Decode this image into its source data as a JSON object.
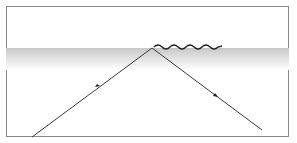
{
  "diagram": {
    "title": "",
    "colors": {
      "ray": "#3a3a3a",
      "frame": "#8a8a8a",
      "interface_shade": "#c8c8c8"
    },
    "incident_ray": {
      "from": [
        32,
        137
      ],
      "to": [
        152,
        48
      ]
    },
    "reflected_ray": {
      "from": [
        152,
        48
      ],
      "to": [
        262,
        130
      ]
    },
    "evanescent_wave": {
      "start_x": 155,
      "end_x": 222,
      "y": 47,
      "cycles": 4
    }
  }
}
